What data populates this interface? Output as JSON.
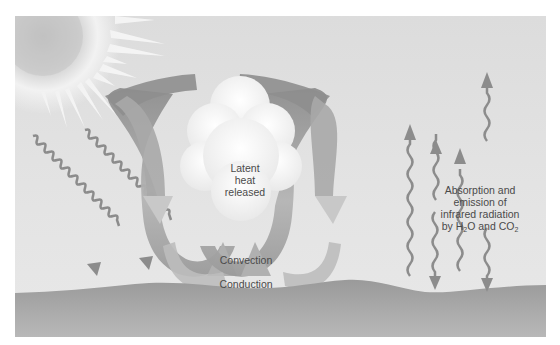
{
  "diagram": {
    "title": "",
    "elements": {
      "sun": {
        "icon": "sun-icon"
      },
      "solar_radiation": {
        "icon": "wavy-arrow-down-icon",
        "count": 2
      },
      "cloud": {
        "icon": "cloud-icon"
      },
      "convection_loops": {
        "icon": "circular-arrow-icon",
        "count": 2
      },
      "infrared_arrows": {
        "icon": "wavy-arrow-vertical-icon",
        "count": 4
      },
      "ground": {
        "icon": "ground-surface"
      }
    },
    "labels": {
      "latent_heat_line1": "Latent",
      "latent_heat_line2": "heat",
      "latent_heat_line3": "released",
      "convection": "Convection",
      "conduction": "Conduction",
      "absorption_line1": "Absorption and",
      "absorption_line2": "emission of",
      "absorption_line3": "infrared radiation",
      "absorption_line4_pre": "by H",
      "absorption_line4_sub1": "2",
      "absorption_line4_mid": "O and CO",
      "absorption_line4_sub2": "2"
    },
    "colors": {
      "sky": "#e0e0e0",
      "ground": "#a8a8a8",
      "arrow": "#8c8c8c",
      "text": "#4a4a4a",
      "cloud": "#f4f4f4"
    }
  }
}
